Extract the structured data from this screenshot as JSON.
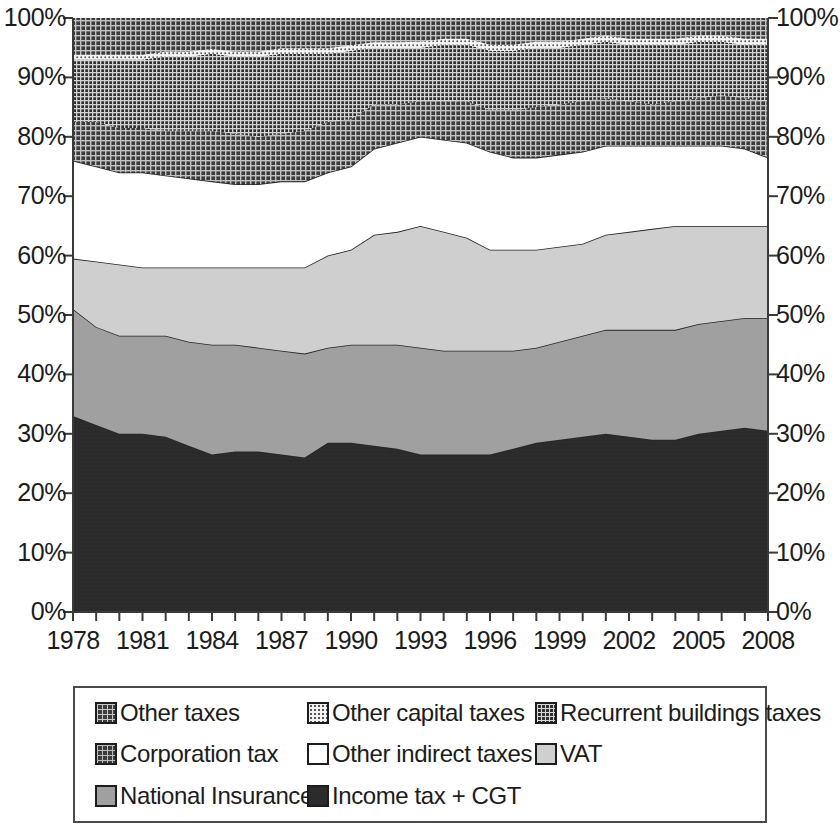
{
  "chart_data": {
    "type": "area",
    "stacked": true,
    "normalized": true,
    "title": "",
    "subtitle": "",
    "xlabel": "",
    "ylabel": "",
    "xlim": [
      1978,
      2008
    ],
    "ylim": [
      0,
      100
    ],
    "grid": false,
    "legend_position": "bottom",
    "y_tick_labels": [
      "100%",
      "90%",
      "80%",
      "70%",
      "60%",
      "50%",
      "40%",
      "30%",
      "20%",
      "10%",
      "0%"
    ],
    "y_tick_values": [
      100,
      90,
      80,
      70,
      60,
      50,
      40,
      30,
      20,
      10,
      0
    ],
    "y_axis_left_labels": [
      "100%",
      "90%",
      "80%",
      "70%",
      "60%",
      "50%",
      "40%",
      "30%",
      "20%",
      "10%",
      "0%"
    ],
    "y_axis_right_labels": [
      "100%",
      "90%",
      "80%",
      "70%",
      "60%",
      "50%",
      "40%",
      "30%",
      "20%",
      "10%",
      "0%"
    ],
    "x_tick_labels": [
      "1978",
      "1981",
      "1984",
      "1987",
      "1990",
      "1993",
      "1996",
      "1999",
      "2002",
      "2005",
      "2008"
    ],
    "x_tick_values": [
      1978,
      1981,
      1984,
      1987,
      1990,
      1993,
      1996,
      1999,
      2002,
      2005,
      2008
    ],
    "x": [
      1978,
      1979,
      1980,
      1981,
      1982,
      1983,
      1984,
      1985,
      1986,
      1987,
      1988,
      1989,
      1990,
      1991,
      1992,
      1993,
      1994,
      1995,
      1996,
      1997,
      1998,
      1999,
      2000,
      2001,
      2002,
      2003,
      2004,
      2005,
      2006,
      2007,
      2008
    ],
    "series": [
      {
        "name": "Income tax + CGT",
        "color": "#2b2b2b",
        "pattern": "solid",
        "values": [
          33.0,
          31.5,
          30.0,
          30.0,
          29.5,
          28.0,
          26.5,
          27.0,
          27.0,
          26.5,
          26.0,
          28.5,
          28.5,
          28.0,
          27.5,
          26.5,
          26.5,
          26.5,
          26.5,
          27.5,
          28.5,
          29.0,
          29.5,
          30.0,
          29.5,
          29.0,
          29.0,
          30.0,
          30.5,
          31.0,
          30.5
        ]
      },
      {
        "name": "National Insurance",
        "color": "#a0a0a0",
        "pattern": "solid",
        "values": [
          18.0,
          16.5,
          16.5,
          16.5,
          17.0,
          17.5,
          18.5,
          18.0,
          17.5,
          17.5,
          17.5,
          16.0,
          16.5,
          17.0,
          17.5,
          18.0,
          17.5,
          17.5,
          17.5,
          16.5,
          16.0,
          16.5,
          17.0,
          17.5,
          18.0,
          18.5,
          18.5,
          18.5,
          18.5,
          18.5,
          19.0
        ]
      },
      {
        "name": "VAT",
        "color": "#cfcfcf",
        "pattern": "solid",
        "values": [
          8.5,
          11.0,
          12.0,
          11.5,
          11.5,
          12.5,
          13.0,
          13.0,
          13.5,
          14.0,
          14.5,
          15.5,
          16.0,
          18.5,
          19.0,
          20.5,
          20.0,
          19.0,
          17.0,
          17.0,
          16.5,
          16.0,
          15.5,
          16.0,
          16.5,
          17.0,
          17.5,
          16.5,
          16.0,
          15.5,
          15.5
        ]
      },
      {
        "name": "Other indirect taxes",
        "color": "#ffffff",
        "pattern": "solid",
        "values": [
          16.5,
          16.0,
          15.5,
          16.0,
          15.5,
          15.0,
          14.5,
          14.0,
          14.0,
          14.5,
          14.5,
          14.0,
          14.0,
          14.5,
          15.0,
          15.0,
          15.5,
          16.0,
          16.5,
          15.5,
          15.5,
          15.5,
          15.5,
          15.0,
          14.5,
          14.0,
          13.5,
          13.5,
          13.5,
          13.0,
          11.5
        ]
      },
      {
        "name": "Corporation tax",
        "color": "#3b3b3b",
        "pattern": "grid-dark",
        "values": [
          6.5,
          7.5,
          7.5,
          7.5,
          7.5,
          8.0,
          8.5,
          8.5,
          8.0,
          8.0,
          8.5,
          8.5,
          8.0,
          7.5,
          6.5,
          6.0,
          6.5,
          7.0,
          7.0,
          8.0,
          8.5,
          8.5,
          8.5,
          8.0,
          7.5,
          7.0,
          7.5,
          8.0,
          8.5,
          8.5,
          9.5
        ]
      },
      {
        "name": "Recurrent buildings taxes",
        "color": "#2e2e2e",
        "pattern": "grid-fine",
        "values": [
          10.5,
          10.5,
          11.5,
          11.5,
          12.5,
          12.5,
          13.0,
          13.0,
          13.5,
          13.5,
          13.0,
          11.5,
          11.5,
          9.5,
          9.5,
          9.0,
          9.5,
          9.5,
          10.0,
          10.0,
          10.0,
          9.5,
          9.5,
          9.5,
          9.5,
          10.0,
          9.5,
          9.5,
          9.0,
          9.0,
          9.5
        ]
      },
      {
        "name": "Other capital taxes",
        "color": "#f2f2f2",
        "pattern": "dotted",
        "values": [
          0.8,
          0.8,
          0.8,
          0.8,
          0.8,
          0.8,
          0.8,
          0.8,
          0.8,
          0.9,
          0.9,
          0.9,
          0.9,
          0.9,
          0.9,
          1.0,
          1.0,
          1.0,
          1.0,
          1.0,
          1.0,
          1.0,
          1.0,
          1.0,
          1.0,
          1.0,
          1.0,
          1.0,
          1.0,
          1.0,
          1.0
        ]
      },
      {
        "name": "Other taxes",
        "color": "#3b3b3b",
        "pattern": "grid-dark",
        "values": [
          6.2,
          6.2,
          6.2,
          6.2,
          5.7,
          5.7,
          5.2,
          5.7,
          5.7,
          5.1,
          5.1,
          5.1,
          4.6,
          4.1,
          4.1,
          4.0,
          3.5,
          3.5,
          4.5,
          4.5,
          4.0,
          4.0,
          3.5,
          3.0,
          3.5,
          3.5,
          3.5,
          3.0,
          3.0,
          3.5,
          3.5
        ]
      }
    ],
    "annotations": []
  },
  "legend": {
    "rows": [
      [
        {
          "label": "Other taxes",
          "swatch": "other-taxes"
        },
        {
          "label": "Other capital taxes",
          "swatch": "other-capital"
        },
        {
          "label": "Recurrent buildings taxes",
          "swatch": "recurrent"
        }
      ],
      [
        {
          "label": "Corporation tax",
          "swatch": "corporation"
        },
        {
          "label": "Other indirect taxes",
          "swatch": "other-indirect"
        },
        {
          "label": "VAT",
          "swatch": "vat"
        }
      ],
      [
        {
          "label": "National Insurance",
          "swatch": "ni"
        },
        {
          "label": "Income tax + CGT",
          "swatch": "income"
        }
      ]
    ]
  }
}
